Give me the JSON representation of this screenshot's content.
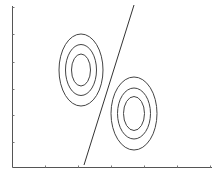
{
  "diagram": {
    "axes": {
      "origin": [
        12.5,
        167.5
      ],
      "x_end": 212,
      "y_top": 6,
      "x_ticks": [
        45,
        78,
        111,
        144,
        177,
        210
      ],
      "y_ticks": [
        7,
        34,
        62,
        89,
        115,
        142
      ],
      "x_labels": [],
      "y_labels": []
    },
    "clusters": [
      {
        "name": "class-a",
        "center": [
          81,
          70
        ],
        "contours": [
          {
            "rx": 22,
            "ry": 36
          },
          {
            "rx": 15.5,
            "ry": 25.5
          },
          {
            "rx": 9.5,
            "ry": 16
          }
        ]
      },
      {
        "name": "class-b",
        "center": [
          134,
          113.5
        ],
        "contours": [
          {
            "rx": 23,
            "ry": 36.5
          },
          {
            "rx": 16.5,
            "ry": 25.5
          },
          {
            "rx": 10.5,
            "ry": 17
          }
        ]
      }
    ],
    "decision_boundary": {
      "x1": 134,
      "y1": 5,
      "x2": 84,
      "y2": 165
    },
    "colors": {
      "axis": "#555555",
      "contour": "#444444",
      "boundary": "#333333",
      "background": "#ffffff"
    }
  }
}
